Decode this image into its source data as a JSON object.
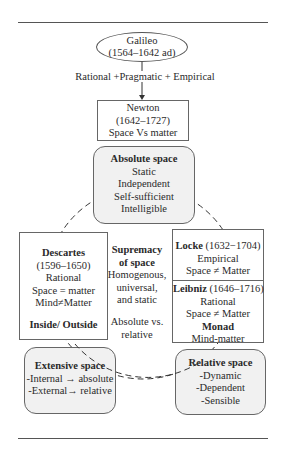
{
  "diagram": {
    "galileo": {
      "name": "Galileo",
      "dates": "(1564–1642 ad)"
    },
    "arrow_label": "Rational +Pragmatic + Empirical",
    "newton": {
      "name": "Newton",
      "dates": "(1642–1727)",
      "note": "Space Vs matter"
    },
    "absolute_space": {
      "title": "Absolute space",
      "items": [
        "Static",
        "Independent",
        "Self-sufficient",
        "Intelligible"
      ]
    },
    "descartes": {
      "name": "Descartes",
      "dates": "(1596–1650)",
      "items": [
        "Rational",
        "Space = matter",
        "Mind≠Matter"
      ],
      "footer": "Inside/ Outside"
    },
    "center": {
      "title_line1": "Supremacy",
      "title_line2": "of space",
      "items": [
        "Homogenous,",
        "universal,",
        "and static"
      ],
      "footer_line1": "Absolute vs.",
      "footer_line2": "relative"
    },
    "locke": {
      "name": "Locke",
      "dates": "(1632−1704)",
      "items": [
        "Empirical",
        "Space ≠ Matter"
      ]
    },
    "leibniz": {
      "name": "Leibniz",
      "dates": "(1646–1716)",
      "items": [
        "Rational",
        "Space ≠ Matter"
      ],
      "concept": "Monad",
      "concept_note": "Mind-matter"
    },
    "extensive_space": {
      "title": "Extensive space",
      "items": [
        "-Internal → absolute",
        "-External→ relative"
      ]
    },
    "relative_space": {
      "title": "Relative space",
      "items": [
        "-Dynamic",
        "-Dependent",
        "-Sensible"
      ]
    }
  }
}
